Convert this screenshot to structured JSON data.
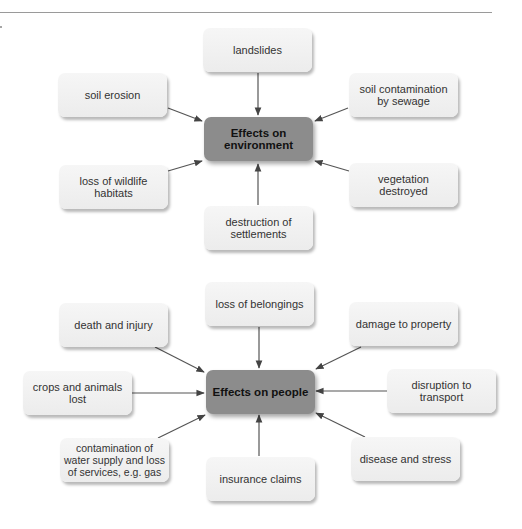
{
  "diagrams": [
    {
      "center": "Effects on environment",
      "nodes": [
        {
          "id": "landslides",
          "label": "landslides"
        },
        {
          "id": "soil-erosion",
          "label": "soil erosion"
        },
        {
          "id": "soil-contamination",
          "label": "soil contamination by sewage"
        },
        {
          "id": "loss-wildlife",
          "label": "loss of wildlife habitats"
        },
        {
          "id": "vegetation",
          "label": "vegetation destroyed"
        },
        {
          "id": "destruction-settlements",
          "label": "destruction of settlements"
        }
      ]
    },
    {
      "center": "Effects on people",
      "nodes": [
        {
          "id": "loss-belongings",
          "label": "loss of belongings"
        },
        {
          "id": "death-injury",
          "label": "death and injury"
        },
        {
          "id": "damage-property",
          "label": "damage to property"
        },
        {
          "id": "crops-animals",
          "label": "crops and animals lost"
        },
        {
          "id": "disruption-transport",
          "label": "disruption to transport"
        },
        {
          "id": "contamination-water",
          "label": "contamination of water supply and loss of services, e.g. gas"
        },
        {
          "id": "insurance",
          "label": "insurance claims"
        },
        {
          "id": "disease-stress",
          "label": "disease and stress"
        }
      ]
    }
  ]
}
